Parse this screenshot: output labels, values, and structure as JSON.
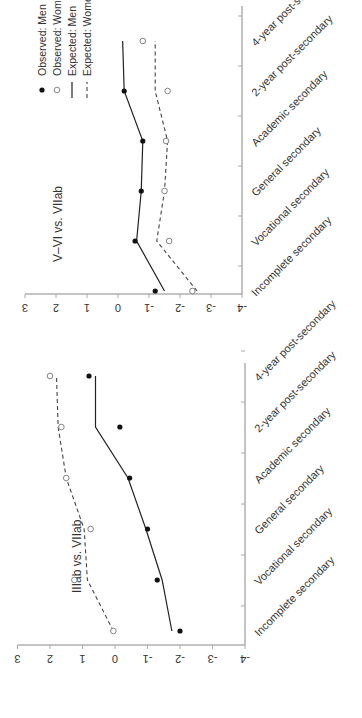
{
  "chart_data": [
    {
      "type": "line",
      "title": "IIIab vs. VIIab",
      "xlabel": "",
      "ylabel": "",
      "ylim": [
        -4,
        3
      ],
      "yticks": [
        "3",
        "2",
        "1",
        "0",
        "-1",
        "-2",
        "-3",
        "-4"
      ],
      "grid": false,
      "categories": [
        "Incomplete secondary",
        "Vocational secondary",
        "General secondary",
        "Academic secondary",
        "2-year post-secondary",
        "4-year post-secondary"
      ],
      "series": [
        {
          "name": "Observed: Men",
          "style": "filled-dot",
          "values": [
            -2.0,
            -1.3,
            -1.0,
            -0.45,
            -0.15,
            0.8
          ]
        },
        {
          "name": "Observed: Women",
          "style": "open-dot",
          "values": [
            0.05,
            1.25,
            0.75,
            1.5,
            1.65,
            2.0
          ]
        },
        {
          "name": "Expected: Men",
          "style": "solid-line",
          "values": [
            -1.75,
            -1.45,
            -0.95,
            -0.4,
            0.6,
            0.6
          ]
        },
        {
          "name": "Expected: Women",
          "style": "dashed-line",
          "values": [
            0.05,
            0.85,
            0.95,
            1.5,
            1.75,
            1.8
          ]
        }
      ]
    },
    {
      "type": "line",
      "title": "V–VI vs. VIIab",
      "xlabel": "",
      "ylabel": "",
      "ylim": [
        -4,
        3
      ],
      "yticks": [
        "3",
        "2",
        "1",
        "0",
        "-1",
        "-2",
        "-3",
        "-4"
      ],
      "grid": false,
      "legend_position": "upper right",
      "categories": [
        "Incomplete secondary",
        "Vocational secondary",
        "General secondary",
        "Academic secondary",
        "2-year post-secondary",
        "4-year post-secondary"
      ],
      "series": [
        {
          "name": "Observed: Men",
          "style": "filled-dot",
          "values": [
            -1.2,
            -0.55,
            -0.75,
            -0.8,
            -0.2,
            -0.8
          ]
        },
        {
          "name": "Observed: Women",
          "style": "open-dot",
          "values": [
            -2.4,
            -1.65,
            -1.5,
            -1.55,
            -1.6,
            -0.8
          ]
        },
        {
          "name": "Expected: Men",
          "style": "solid-line",
          "values": [
            -1.5,
            -0.6,
            -0.75,
            -0.8,
            -0.2,
            -0.15
          ]
        },
        {
          "name": "Expected: Women",
          "style": "dashed-line",
          "values": [
            -2.55,
            -1.25,
            -1.5,
            -1.6,
            -1.2,
            -1.2
          ]
        }
      ]
    }
  ],
  "legend": {
    "items": [
      {
        "label": "Observed: Men"
      },
      {
        "label": "Observed: Women"
      },
      {
        "label": "Expected: Men"
      },
      {
        "label": "Expected: Women"
      }
    ]
  },
  "colors": {
    "men": "#111111",
    "women": "#777777",
    "axis": "#888888"
  }
}
